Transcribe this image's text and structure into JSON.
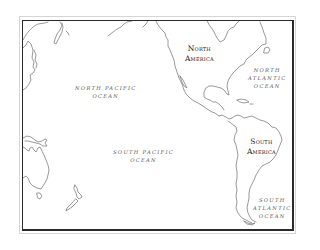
{
  "map": {
    "type": "outline-map",
    "region": "Pacific Ocean and the Americas",
    "colors": {
      "background": "#ffffff",
      "coastline": "#6e6e6e",
      "frame_inner": "#2a2a2a",
      "frame_outer": "#d6d6d6",
      "label_text": "#3a3a3a"
    },
    "labels": {
      "north_pacific": {
        "line1": "NORTH PACIFIC",
        "line2": "OCEAN"
      },
      "south_pacific": {
        "line1": "SOUTH PACIFIC",
        "line2": "OCEAN"
      },
      "north_atlantic": {
        "line1": "NORTH",
        "line2": "ATLANTIC",
        "line3": "OCEAN"
      },
      "south_atlantic": {
        "line1": "SOUTH",
        "line2": "ATLANTIC",
        "line3": "OCEAN"
      },
      "north_america": {
        "line1": "North",
        "line2": "America"
      },
      "south_america": {
        "line1": "South",
        "line2": "America"
      }
    },
    "landmasses": [
      "Asia (east coast)",
      "Japan",
      "Alaska / North America",
      "Central America",
      "Caribbean islands",
      "South America",
      "Australia",
      "New Guinea",
      "New Zealand",
      "Tasmania"
    ]
  }
}
